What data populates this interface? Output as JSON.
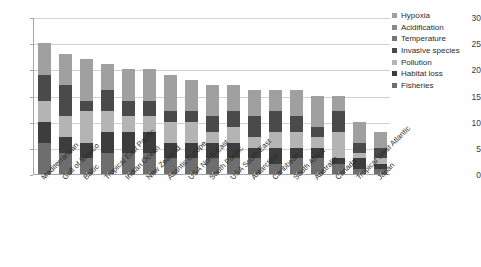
{
  "chart_data": {
    "type": "bar",
    "stacked": true,
    "title": "",
    "xlabel": "",
    "ylabel": "",
    "ylim": [
      0,
      30
    ],
    "ytick_values": [
      0,
      5,
      10,
      15,
      20,
      25,
      30
    ],
    "ytick_labels": [
      "0",
      "5",
      "10",
      "15",
      "20",
      "25",
      "30"
    ],
    "grid": true,
    "legend_position": "right",
    "categories": [
      "Mediterranean",
      "Gulf of Mexico",
      "Baltic",
      "Tropical East Pacific",
      "Indian Ocean",
      "New Zealand",
      "Atlantic Europe",
      "USA North East",
      "South Pacific",
      "USA South East",
      "Antarctica",
      "Caribbean",
      "South Africa",
      "Australia",
      "Canada",
      "Tropical West Atlantic",
      "Japan"
    ],
    "totals": [
      25,
      23,
      22,
      21,
      20,
      20,
      19,
      18,
      17,
      17,
      16,
      16,
      16,
      15,
      15,
      10,
      8
    ],
    "stack_order_bottom_to_top": [
      "Fisheries",
      "Habitat loss",
      "Pollution",
      "Invasive species",
      "Temperature",
      "Acidification",
      "Hypoxia"
    ],
    "series": [
      {
        "name": "Hypoxia",
        "color": "#a0a0a0",
        "values": [
          6,
          6,
          8,
          5,
          6,
          6,
          7,
          6,
          6,
          5,
          5,
          4,
          5,
          6,
          3,
          4,
          3
        ]
      },
      {
        "name": "Acidification",
        "color": "#8a8a8a",
        "values": [
          0,
          0,
          0,
          0,
          0,
          0,
          0,
          0,
          0,
          0,
          0,
          0,
          0,
          0,
          0,
          0,
          0
        ]
      },
      {
        "name": "Temperature",
        "color": "#777777",
        "values": [
          0,
          0,
          0,
          0,
          0,
          0,
          0,
          0,
          0,
          0,
          0,
          0,
          0,
          0,
          0,
          0,
          0
        ]
      },
      {
        "name": "Invasive species",
        "color": "#4a4a4a",
        "values": [
          5,
          6,
          2,
          4,
          3,
          3,
          2,
          2,
          3,
          3,
          4,
          4,
          3,
          2,
          4,
          2,
          2
        ]
      },
      {
        "name": "Pollution",
        "color": "#b4b4b4",
        "values": [
          4,
          4,
          6,
          4,
          3,
          3,
          4,
          4,
          2,
          3,
          2,
          3,
          3,
          2,
          5,
          1,
          1
        ]
      },
      {
        "name": "Habitat loss",
        "color": "#3d3d3d",
        "values": [
          4,
          3,
          3,
          4,
          4,
          4,
          3,
          3,
          3,
          3,
          2,
          3,
          2,
          2,
          1,
          2,
          1
        ]
      },
      {
        "name": "Fisheries",
        "color": "#6e6e6e",
        "values": [
          6,
          4,
          3,
          4,
          4,
          4,
          3,
          3,
          3,
          3,
          3,
          2,
          3,
          3,
          2,
          1,
          1
        ]
      }
    ]
  },
  "legend": {
    "items": [
      {
        "label": "Hypoxia",
        "color": "#a0a0a0"
      },
      {
        "label": "Acidification",
        "color": "#8a8a8a"
      },
      {
        "label": "Temperature",
        "color": "#777777"
      },
      {
        "label": "Invasive species",
        "color": "#4a4a4a"
      },
      {
        "label": "Pollution",
        "color": "#b4b4b4"
      },
      {
        "label": "Habitat loss",
        "color": "#3d3d3d"
      },
      {
        "label": "Fisheries",
        "color": "#6e6e6e"
      }
    ]
  }
}
